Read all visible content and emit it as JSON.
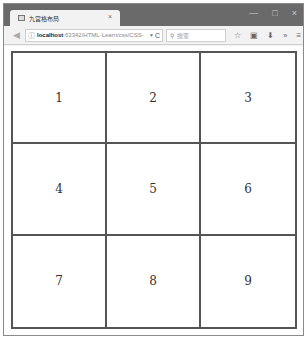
{
  "browser": {
    "tab": {
      "title": "九宫格布局",
      "close_glyph": "×"
    },
    "window_controls": {
      "minimize": "—",
      "maximize": "□",
      "close": "×"
    },
    "toolbar": {
      "back_glyph": "◀",
      "url_host": "localhost",
      "url_rest": ":63342/HTML-Learn/css/CSS-",
      "url_dropdown": "▼",
      "reload_glyph": "C",
      "search_placeholder": "搜索",
      "search_glyph": "⚲",
      "icons": [
        "☆",
        "▣",
        "⬇",
        "»",
        "≡"
      ]
    }
  },
  "page": {
    "grid": {
      "cells": [
        "1",
        "2",
        "3",
        "4",
        "5",
        "6",
        "7",
        "8",
        "9"
      ],
      "border_color": "#555555"
    }
  }
}
